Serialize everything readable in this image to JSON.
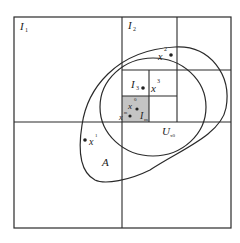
{
  "diagram": {
    "colors": {
      "line": "#2a2a2a",
      "shaded_cell": "#c4c4c4",
      "background": "#ffffff"
    },
    "labels": {
      "I1": {
        "base": "I",
        "sub": "1"
      },
      "I2": {
        "base": "I",
        "sub": "2"
      },
      "I3": {
        "base": "I",
        "sub": "3"
      },
      "Im": {
        "base": "I",
        "sub": "m"
      },
      "A": {
        "base": "A"
      },
      "U": {
        "base": "U",
        "sub": "x0"
      }
    },
    "points": [
      {
        "id": "x1",
        "base": "x",
        "sup": "1"
      },
      {
        "id": "x2",
        "base": "x",
        "sup": "2"
      },
      {
        "id": "x3",
        "base": "x",
        "sup": "3"
      },
      {
        "id": "x0",
        "base": "x",
        "sup": "0"
      },
      {
        "id": "xm",
        "base": "x",
        "sup": "m"
      }
    ]
  }
}
